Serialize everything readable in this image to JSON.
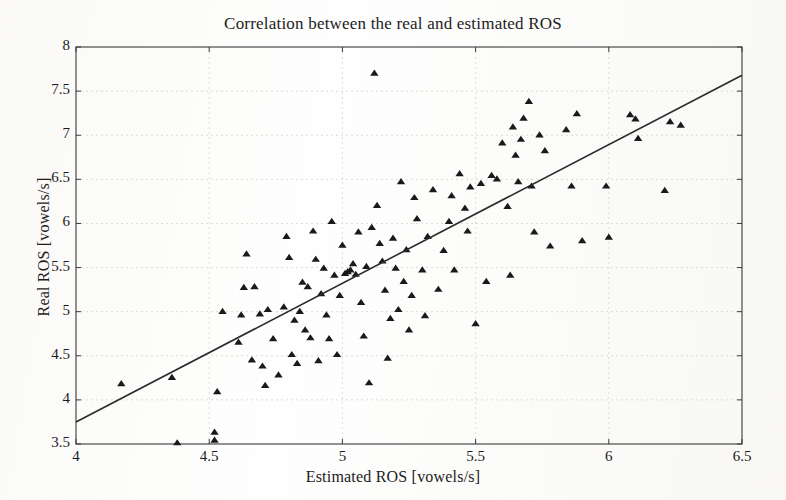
{
  "chart_data": {
    "type": "scatter",
    "title": "Correlation between the real and estimated ROS",
    "xlabel": "Estimated ROS [vowels/s]",
    "ylabel": "Real ROS [vowels/s]",
    "xlim": [
      4,
      6.5
    ],
    "ylim": [
      3.5,
      8
    ],
    "xticks": [
      4,
      4.5,
      5,
      5.5,
      6,
      6.5
    ],
    "xtick_labels": [
      "4",
      "4.5",
      "5",
      "5.5",
      "6",
      "6.5"
    ],
    "yticks": [
      3.5,
      4,
      4.5,
      5,
      5.5,
      6,
      6.5,
      7,
      7.5,
      8
    ],
    "ytick_labels": [
      "3.5",
      "4",
      "4.5",
      "5",
      "5.5",
      "6",
      "6.5",
      "7",
      "7.5",
      "8"
    ],
    "grid": true,
    "legend": null,
    "marker": "triangle",
    "marker_color": "#1a1a1a",
    "line_color": "#2b2b2b",
    "series": [
      {
        "name": "observations",
        "marker": "triangle",
        "points": [
          [
            4.17,
            4.19
          ],
          [
            4.38,
            3.52
          ],
          [
            4.36,
            4.26
          ],
          [
            4.52,
            3.55
          ],
          [
            4.52,
            3.64
          ],
          [
            4.53,
            4.1
          ],
          [
            4.55,
            5.01
          ],
          [
            4.61,
            4.66
          ],
          [
            4.62,
            4.97
          ],
          [
            4.63,
            5.28
          ],
          [
            4.64,
            5.66
          ],
          [
            4.66,
            4.46
          ],
          [
            4.67,
            5.29
          ],
          [
            4.69,
            4.98
          ],
          [
            4.7,
            4.39
          ],
          [
            4.71,
            4.17
          ],
          [
            4.72,
            5.03
          ],
          [
            4.74,
            4.7
          ],
          [
            4.76,
            4.29
          ],
          [
            4.78,
            5.06
          ],
          [
            4.79,
            5.86
          ],
          [
            4.8,
            5.62
          ],
          [
            4.81,
            4.52
          ],
          [
            4.82,
            4.91
          ],
          [
            4.83,
            4.42
          ],
          [
            4.84,
            5.01
          ],
          [
            4.85,
            5.34
          ],
          [
            4.86,
            4.8
          ],
          [
            4.87,
            5.29
          ],
          [
            4.88,
            4.71
          ],
          [
            4.89,
            5.92
          ],
          [
            4.9,
            5.6
          ],
          [
            4.91,
            4.45
          ],
          [
            4.92,
            5.21
          ],
          [
            4.93,
            5.5
          ],
          [
            4.94,
            4.97
          ],
          [
            4.95,
            4.7
          ],
          [
            4.96,
            6.03
          ],
          [
            4.97,
            5.42
          ],
          [
            4.98,
            4.52
          ],
          [
            4.99,
            5.19
          ],
          [
            5.0,
            5.76
          ],
          [
            5.01,
            5.44
          ],
          [
            5.02,
            5.46
          ],
          [
            5.03,
            5.48
          ],
          [
            5.04,
            5.55
          ],
          [
            5.05,
            5.43
          ],
          [
            5.06,
            5.91
          ],
          [
            5.07,
            5.11
          ],
          [
            5.08,
            4.73
          ],
          [
            5.09,
            5.52
          ],
          [
            5.1,
            4.2
          ],
          [
            5.11,
            5.96
          ],
          [
            5.12,
            7.71
          ],
          [
            5.13,
            6.21
          ],
          [
            5.14,
            5.78
          ],
          [
            5.15,
            5.58
          ],
          [
            5.16,
            5.25
          ],
          [
            5.17,
            4.48
          ],
          [
            5.18,
            4.93
          ],
          [
            5.19,
            5.84
          ],
          [
            5.2,
            5.5
          ],
          [
            5.21,
            5.03
          ],
          [
            5.22,
            6.48
          ],
          [
            5.23,
            5.35
          ],
          [
            5.24,
            5.71
          ],
          [
            5.25,
            4.8
          ],
          [
            5.26,
            5.19
          ],
          [
            5.27,
            6.3
          ],
          [
            5.28,
            6.06
          ],
          [
            5.3,
            5.48
          ],
          [
            5.31,
            4.96
          ],
          [
            5.32,
            5.86
          ],
          [
            5.34,
            6.39
          ],
          [
            5.36,
            5.26
          ],
          [
            5.38,
            5.7
          ],
          [
            5.4,
            6.03
          ],
          [
            5.41,
            6.32
          ],
          [
            5.42,
            5.48
          ],
          [
            5.44,
            6.57
          ],
          [
            5.46,
            6.18
          ],
          [
            5.47,
            5.92
          ],
          [
            5.48,
            6.42
          ],
          [
            5.5,
            4.87
          ],
          [
            5.52,
            6.46
          ],
          [
            5.54,
            5.35
          ],
          [
            5.56,
            6.55
          ],
          [
            5.58,
            6.51
          ],
          [
            5.6,
            6.92
          ],
          [
            5.62,
            6.2
          ],
          [
            5.63,
            5.42
          ],
          [
            5.64,
            7.1
          ],
          [
            5.65,
            6.78
          ],
          [
            5.66,
            6.48
          ],
          [
            5.67,
            6.96
          ],
          [
            5.68,
            7.2
          ],
          [
            5.7,
            7.39
          ],
          [
            5.71,
            6.43
          ],
          [
            5.72,
            5.91
          ],
          [
            5.74,
            7.01
          ],
          [
            5.76,
            6.83
          ],
          [
            5.78,
            5.75
          ],
          [
            5.84,
            7.07
          ],
          [
            5.86,
            6.43
          ],
          [
            5.88,
            7.25
          ],
          [
            5.9,
            5.81
          ],
          [
            5.99,
            6.43
          ],
          [
            6.0,
            5.85
          ],
          [
            6.08,
            7.24
          ],
          [
            6.1,
            7.19
          ],
          [
            6.11,
            6.97
          ],
          [
            6.21,
            6.38
          ],
          [
            6.23,
            7.16
          ],
          [
            6.27,
            7.12
          ]
        ]
      }
    ],
    "fit_line": {
      "name": "regression-line",
      "x0": 4.0,
      "y0": 3.75,
      "x1": 6.5,
      "y1": 7.68
    }
  }
}
